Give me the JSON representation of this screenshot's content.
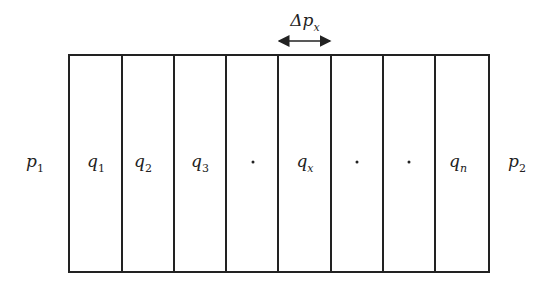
{
  "diagram": {
    "box": {
      "left": 69,
      "top": 55,
      "right": 489,
      "bottom": 272
    },
    "dividers_x": [
      122,
      174,
      226,
      278,
      331,
      383,
      435
    ],
    "outer_labels": [
      {
        "id": "p1",
        "base": "p",
        "sub": "1",
        "x": 35,
        "y": 163
      },
      {
        "id": "p2",
        "base": "p",
        "sub": "2",
        "x": 517,
        "y": 163
      }
    ],
    "cells": [
      {
        "type": "label",
        "base": "q",
        "sub": "1",
        "x": 96,
        "y": 163
      },
      {
        "type": "label",
        "base": "q",
        "sub": "2",
        "x": 143,
        "y": 163
      },
      {
        "type": "label",
        "base": "q",
        "sub": "3",
        "x": 200,
        "y": 163
      },
      {
        "type": "dot",
        "x": 253,
        "y": 162
      },
      {
        "type": "label",
        "base": "q",
        "sub": "x",
        "x": 305,
        "y": 163
      },
      {
        "type": "dot",
        "x": 357,
        "y": 162
      },
      {
        "type": "dot",
        "x": 409,
        "y": 162
      },
      {
        "type": "label",
        "base": "q",
        "sub": "n",
        "x": 458,
        "y": 163
      }
    ],
    "width_marker": {
      "label_base": "Δp",
      "label_sub": "x",
      "label_x": 305,
      "label_y": 22,
      "arrow_x1": 278,
      "arrow_x2": 331,
      "arrow_y": 41
    },
    "stroke_color": "#222222"
  }
}
